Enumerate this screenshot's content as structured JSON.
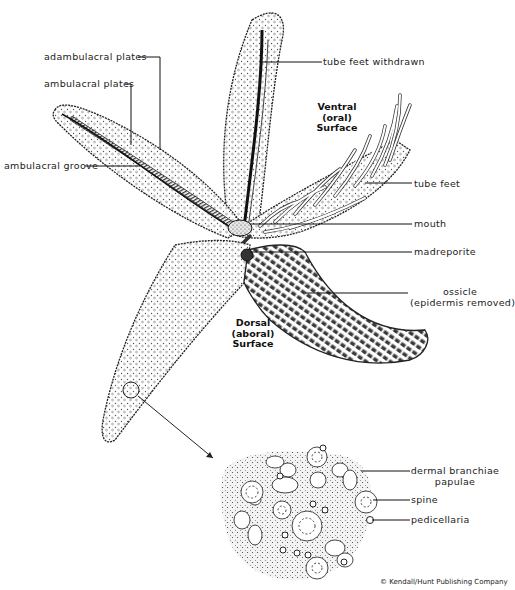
{
  "diagram": {
    "views": {
      "ventral": {
        "line1": "Ventral",
        "line2": "(oral)",
        "line3": "Surface"
      },
      "dorsal": {
        "line1": "Dorsal",
        "line2": "(aboral)",
        "line3": "Surface"
      }
    },
    "labels": {
      "adambulacral_plates": "adambulacral plates",
      "ambulacral_plates": "ambulacral plates",
      "ambulacral_groove": "ambulacral groove",
      "tube_feet_withdrawn": "tube feet withdrawn",
      "tube_feet": "tube feet",
      "mouth": "mouth",
      "madreporite": "madreporite",
      "ossicle": "ossicle",
      "ossicle_note": "(epidermis removed)",
      "dermal_branchiae": "dermal branchiae",
      "papulae": "papulae",
      "spine": "spine",
      "pedicellaria": "pedicellaria"
    },
    "credit": "© Kendall/Hunt Publishing Company",
    "colors": {
      "ink": "#1a1a1a",
      "background": "#ffffff",
      "stipple": "#9a9a9a"
    }
  }
}
